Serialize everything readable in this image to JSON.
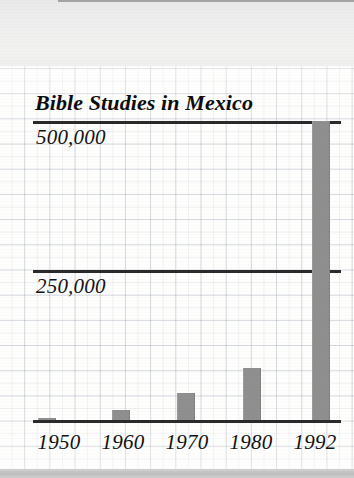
{
  "page": {
    "background_color": "#fdfdfb",
    "grid_line_color": "#96a0af",
    "top_band_color": "#eeeeee",
    "bottom_band_color": "#c6c6c6"
  },
  "chart_data": {
    "type": "bar",
    "title": "Bible Studies in Mexico",
    "xlabel": "",
    "ylabel": "",
    "categories": [
      "1950",
      "1960",
      "1970",
      "1980",
      "1992"
    ],
    "values": [
      4000,
      17000,
      45000,
      87000,
      510000
    ],
    "ylim": [
      0,
      520000
    ],
    "ytick_labels": [
      "250,000",
      "500,000"
    ],
    "ytick_values": [
      250000,
      500000
    ],
    "grid": true,
    "legend": null,
    "bar_color": "#8f8f8f",
    "rule_color": "#2a2a2a",
    "annotations": []
  },
  "axis": {
    "label_500": "500,000",
    "label_250": "250,000"
  },
  "bars": [
    {
      "year": "1950",
      "left_px": 38,
      "width_px": 17,
      "top_px": 418,
      "height_px": 3
    },
    {
      "year": "1960",
      "left_px": 112,
      "width_px": 17,
      "top_px": 410,
      "height_px": 11
    },
    {
      "year": "1970",
      "left_px": 177,
      "width_px": 17,
      "top_px": 393,
      "height_px": 28
    },
    {
      "year": "1980",
      "left_px": 243,
      "width_px": 17,
      "top_px": 368,
      "height_px": 53
    },
    {
      "year": "1992",
      "left_px": 312,
      "width_px": 17,
      "top_px": 121,
      "height_px": 300
    }
  ]
}
